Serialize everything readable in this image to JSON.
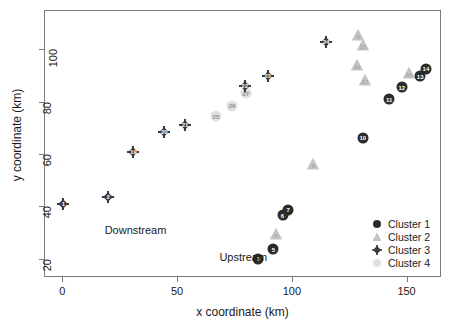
{
  "chart_data": {
    "type": "scatter",
    "title": "",
    "xlabel": "x coordinate (km)",
    "ylabel": "y coordinate (km)",
    "xlim": [
      -8,
      165
    ],
    "ylim": [
      13,
      115
    ],
    "xticks": [
      0,
      50,
      100,
      150
    ],
    "yticks": [
      20,
      40,
      60,
      80,
      100
    ],
    "grid": false,
    "legend_position": "bottom-right",
    "series": [
      {
        "name": "Cluster 1",
        "marker": "circle",
        "color": "#2b2b2b",
        "points": [
          {
            "label": "3",
            "x": 85.0,
            "y": 20.3
          },
          {
            "label": "5",
            "x": 91.5,
            "y": 24.0
          },
          {
            "label": "6",
            "x": 95.5,
            "y": 37.0
          },
          {
            "label": "7",
            "x": 98.0,
            "y": 39.0
          },
          {
            "label": "10",
            "x": 130.5,
            "y": 66.5
          },
          {
            "label": "11",
            "x": 142.0,
            "y": 81.3
          },
          {
            "label": "12",
            "x": 147.5,
            "y": 85.8
          },
          {
            "label": "13",
            "x": 155.5,
            "y": 90.0
          },
          {
            "label": "14",
            "x": 158.0,
            "y": 93.0
          }
        ]
      },
      {
        "name": "Cluster 2",
        "marker": "triangle",
        "color": "#c4c4c4",
        "points": [
          {
            "label": "4",
            "x": 92.5,
            "y": 30.0
          },
          {
            "label": "8",
            "x": 109.0,
            "y": 56.5
          },
          {
            "label": "9",
            "x": 128.5,
            "y": 106.0
          },
          {
            "label": "15",
            "x": 130.5,
            "y": 102.0
          },
          {
            "label": "16",
            "x": 128.0,
            "y": 94.5
          },
          {
            "label": "17",
            "x": 131.5,
            "y": 88.5
          },
          {
            "label": "18",
            "x": 150.5,
            "y": 91.5
          }
        ]
      },
      {
        "name": "Cluster 3",
        "marker": "diamond-plus",
        "color": "#3a3a3a",
        "points": [
          {
            "label": "1",
            "x": 0.0,
            "y": 41.3
          },
          {
            "label": "2",
            "x": 19.5,
            "y": 43.8
          },
          {
            "label": "19",
            "x": 30.5,
            "y": 61.0
          },
          {
            "label": "20",
            "x": 44.0,
            "y": 68.8
          },
          {
            "label": "21",
            "x": 53.0,
            "y": 71.3
          },
          {
            "label": "22",
            "x": 79.0,
            "y": 86.3
          },
          {
            "label": "23",
            "x": 89.0,
            "y": 90.3
          },
          {
            "label": "24",
            "x": 114.5,
            "y": 103.3
          }
        ]
      },
      {
        "name": "Cluster 4",
        "marker": "circle",
        "color": "#e0e0e0",
        "points": [
          {
            "label": "25",
            "x": 66.5,
            "y": 74.8
          },
          {
            "label": "26",
            "x": 73.5,
            "y": 78.8
          },
          {
            "label": "27",
            "x": 79.5,
            "y": 83.5
          }
        ]
      }
    ],
    "annotations": [
      {
        "text": "Downstream",
        "x": 18.0,
        "y": 31.0
      },
      {
        "text": "Upstream",
        "x": 68.0,
        "y": 20.5
      }
    ]
  },
  "legend": {
    "items": [
      {
        "label": "Cluster 1",
        "marker": "circle",
        "color": "#2b2b2b"
      },
      {
        "label": "Cluster 2",
        "marker": "triangle",
        "color": "#c4c4c4"
      },
      {
        "label": "Cluster 3",
        "marker": "diamond-plus",
        "color": "#3a3a3a"
      },
      {
        "label": "Cluster 4",
        "marker": "circle",
        "color": "#e0e0e0"
      }
    ]
  }
}
